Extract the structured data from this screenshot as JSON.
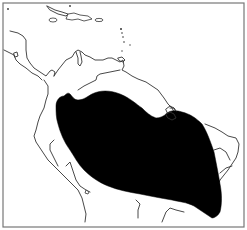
{
  "map": {
    "title": "Distribution range map — northern South America",
    "region": "Northern South America and Caribbean",
    "frame_color": "#777777",
    "coastline_color": "#333333",
    "range_fill_color": "#000000",
    "background_color": "#ffffff",
    "features": [
      {
        "name": "caribbean-islands",
        "type": "coastline"
      },
      {
        "name": "central-america",
        "type": "coastline"
      },
      {
        "name": "south-america-coast",
        "type": "coastline"
      },
      {
        "name": "andes-lines",
        "type": "boundary"
      },
      {
        "name": "species-range",
        "type": "filled-area"
      }
    ]
  }
}
